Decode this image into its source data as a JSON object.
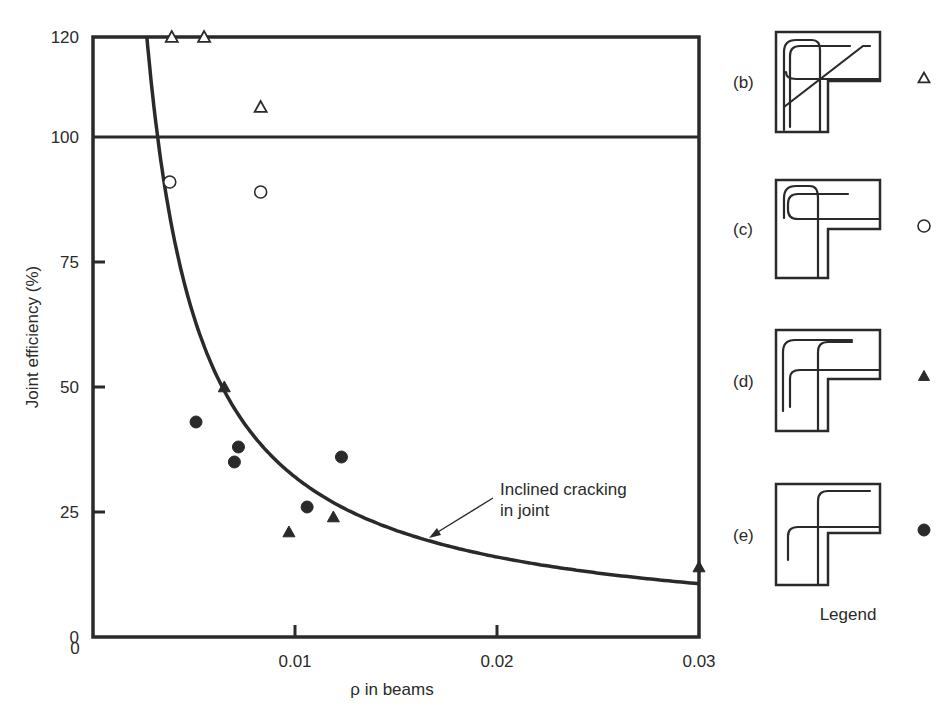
{
  "chart_data": {
    "type": "scatter",
    "title": "",
    "xlabel": "ρ in beams",
    "ylabel": "Joint efficiency (%)",
    "xlim": [
      0,
      0.03
    ],
    "ylim": [
      0,
      120
    ],
    "x_ticks": [
      "0",
      "0.01",
      "0.02",
      "0.03"
    ],
    "y_ticks": [
      "0",
      "25",
      "50",
      "75",
      "100",
      "120"
    ],
    "reference_line": {
      "y": 100
    },
    "grid": false,
    "curve": {
      "label": "Inclined cracking in joint",
      "label_lines": [
        "Inclined cracking",
        "in joint"
      ],
      "equation": "y ≈ 0.32 / x",
      "k": 0.32
    },
    "series": [
      {
        "name": "(b)",
        "marker": "open-triangle",
        "points": [
          [
            0.0039,
            120
          ],
          [
            0.0055,
            120
          ],
          [
            0.0083,
            106
          ]
        ]
      },
      {
        "name": "(c)",
        "marker": "open-circle",
        "points": [
          [
            0.0038,
            91
          ],
          [
            0.0083,
            89
          ]
        ]
      },
      {
        "name": "(d)",
        "marker": "filled-triangle",
        "points": [
          [
            0.0065,
            50
          ],
          [
            0.0119,
            24
          ],
          [
            0.0097,
            21
          ],
          [
            0.03,
            14
          ]
        ]
      },
      {
        "name": "(e)",
        "marker": "filled-circle",
        "points": [
          [
            0.0051,
            43
          ],
          [
            0.0072,
            38
          ],
          [
            0.007,
            35
          ],
          [
            0.0123,
            36
          ],
          [
            0.0106,
            26
          ]
        ]
      }
    ],
    "legend": {
      "title": "Legend",
      "position": "right",
      "entries": [
        {
          "label": "(b)",
          "marker": "open-triangle",
          "detail": "diagonal bar + hooked bars"
        },
        {
          "label": "(c)",
          "marker": "open-circle",
          "detail": "looped hooked bars"
        },
        {
          "label": "(d)",
          "marker": "filled-triangle",
          "detail": "bent bars into column"
        },
        {
          "label": "(e)",
          "marker": "filled-circle",
          "detail": "crossing bent bars"
        }
      ]
    }
  }
}
